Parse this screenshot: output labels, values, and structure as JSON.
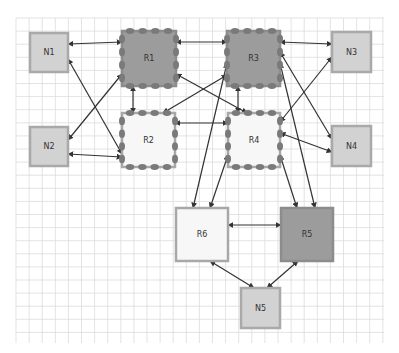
{
  "diagram": {
    "grid": {
      "x": 16,
      "y": 18,
      "width": 368,
      "height": 325,
      "spacing": 13.1,
      "color": "#dcdcdc"
    },
    "colors": {
      "endpoint_fill": "#d2d2d2",
      "endpoint_stroke": "#a9a9a9",
      "router_dark_fill": "#9c9c9c",
      "router_dark_stroke": "#8c8c8c",
      "router_light_fill": "#f7f7f7",
      "router_light_stroke": "#a8a8a8",
      "port_fill": "#7a7a7a",
      "edge_color": "#333333"
    },
    "nodes": [
      {
        "id": "N1",
        "label": "N1",
        "kind": "endpoint",
        "x": 30,
        "y": 33,
        "w": 38,
        "h": 39
      },
      {
        "id": "N2",
        "label": "N2",
        "kind": "endpoint",
        "x": 30,
        "y": 127,
        "w": 38,
        "h": 39
      },
      {
        "id": "N3",
        "label": "N3",
        "kind": "endpoint",
        "x": 332,
        "y": 32,
        "w": 39,
        "h": 40
      },
      {
        "id": "N4",
        "label": "N4",
        "kind": "endpoint",
        "x": 332,
        "y": 126,
        "w": 39,
        "h": 40
      },
      {
        "id": "N5",
        "label": "N5",
        "kind": "endpoint",
        "x": 241,
        "y": 288,
        "w": 39,
        "h": 40
      },
      {
        "id": "R1",
        "label": "R1",
        "kind": "router_dark",
        "x": 122,
        "y": 31,
        "w": 54,
        "h": 55,
        "ports": true
      },
      {
        "id": "R2",
        "label": "R2",
        "kind": "router_light",
        "x": 122,
        "y": 113,
        "w": 53,
        "h": 54,
        "ports": true
      },
      {
        "id": "R3",
        "label": "R3",
        "kind": "router_dark",
        "x": 227,
        "y": 31,
        "w": 53,
        "h": 55,
        "ports": true
      },
      {
        "id": "R4",
        "label": "R4",
        "kind": "router_light",
        "x": 228,
        "y": 113,
        "w": 52,
        "h": 54,
        "ports": true
      },
      {
        "id": "R5",
        "label": "R5",
        "kind": "router_dark",
        "x": 281,
        "y": 208,
        "w": 52,
        "h": 53,
        "ports": false
      },
      {
        "id": "R6",
        "label": "R6",
        "kind": "router_light",
        "x": 176,
        "y": 208,
        "w": 52,
        "h": 53,
        "ports": false
      }
    ],
    "edges": [
      {
        "from": "N1",
        "to": "R1",
        "x1": 68,
        "y1": 44,
        "x2": 122,
        "y2": 42,
        "bidirectional": true
      },
      {
        "from": "N1",
        "to": "R2",
        "x1": 68,
        "y1": 59,
        "x2": 122,
        "y2": 154,
        "bidirectional": true
      },
      {
        "from": "N2",
        "to": "R1",
        "x1": 68,
        "y1": 140,
        "x2": 122,
        "y2": 74,
        "bidirectional": true
      },
      {
        "from": "N2",
        "to": "R2",
        "x1": 68,
        "y1": 154,
        "x2": 122,
        "y2": 157,
        "bidirectional": true
      },
      {
        "from": "R1",
        "to": "R3",
        "x1": 176,
        "y1": 42,
        "x2": 227,
        "y2": 42,
        "bidirectional": true
      },
      {
        "from": "R1",
        "to": "R2",
        "x1": 133,
        "y1": 86,
        "x2": 133,
        "y2": 113,
        "bidirectional": true
      },
      {
        "from": "R1",
        "to": "R4",
        "x1": 176,
        "y1": 74,
        "x2": 247,
        "y2": 113,
        "bidirectional": true
      },
      {
        "from": "R3",
        "to": "R2",
        "x1": 227,
        "y1": 75,
        "x2": 163,
        "y2": 113,
        "bidirectional": true
      },
      {
        "from": "R3",
        "to": "R6",
        "x1": 227,
        "y1": 63,
        "x2": 193,
        "y2": 208,
        "bidirectional": true
      },
      {
        "from": "R3",
        "to": "R4",
        "x1": 238,
        "y1": 86,
        "x2": 238,
        "y2": 113,
        "bidirectional": true
      },
      {
        "from": "R2",
        "to": "R4",
        "x1": 175,
        "y1": 123,
        "x2": 228,
        "y2": 123,
        "bidirectional": true
      },
      {
        "from": "R4",
        "to": "R6",
        "x1": 228,
        "y1": 155,
        "x2": 210,
        "y2": 208,
        "bidirectional": true
      },
      {
        "from": "R3",
        "to": "N3",
        "x1": 280,
        "y1": 42,
        "x2": 332,
        "y2": 44,
        "bidirectional": true
      },
      {
        "from": "R3",
        "to": "N4",
        "x1": 280,
        "y1": 52,
        "x2": 332,
        "y2": 139,
        "bidirectional": true
      },
      {
        "from": "R3",
        "to": "R5",
        "x1": 280,
        "y1": 63,
        "x2": 315,
        "y2": 208,
        "bidirectional": true
      },
      {
        "from": "N3",
        "to": "R4",
        "x1": 332,
        "y1": 57,
        "x2": 280,
        "y2": 122,
        "bidirectional": true
      },
      {
        "from": "R4",
        "to": "N4",
        "x1": 280,
        "y1": 133,
        "x2": 332,
        "y2": 152,
        "bidirectional": true
      },
      {
        "from": "R4",
        "to": "R5",
        "x1": 280,
        "y1": 155,
        "x2": 297,
        "y2": 208,
        "bidirectional": true
      },
      {
        "from": "R6",
        "to": "R5",
        "x1": 228,
        "y1": 225,
        "x2": 281,
        "y2": 225,
        "bidirectional": true
      },
      {
        "from": "R6",
        "to": "N5",
        "x1": 210,
        "y1": 261,
        "x2": 254,
        "y2": 288,
        "bidirectional": true
      },
      {
        "from": "R5",
        "to": "N5",
        "x1": 298,
        "y1": 261,
        "x2": 267,
        "y2": 288,
        "bidirectional": true
      }
    ]
  }
}
